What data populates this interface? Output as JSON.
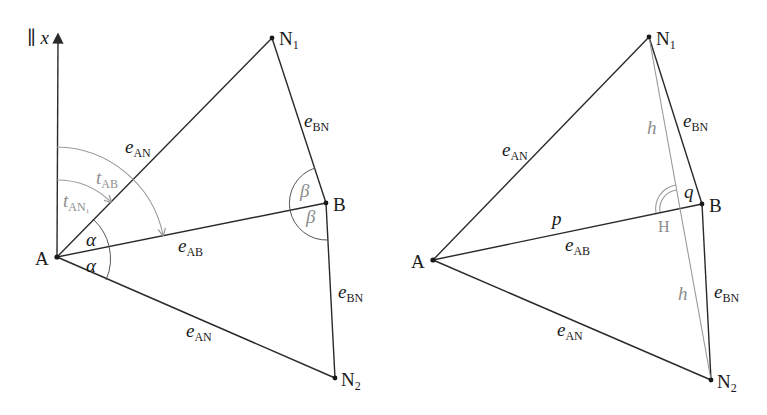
{
  "left_diagram": {
    "axis_label": "∥ x",
    "points": {
      "A": {
        "label": "A",
        "x": 57,
        "y": 257
      },
      "N1": {
        "label": "N",
        "sub": "1",
        "x": 272,
        "y": 38
      },
      "B": {
        "label": "B",
        "x": 326,
        "y": 203
      },
      "N2": {
        "label": "N",
        "sub": "2",
        "x": 335,
        "y": 378
      }
    },
    "edges": {
      "eAN_top": {
        "main": "e",
        "sub": "AN"
      },
      "eAB": {
        "main": "e",
        "sub": "AB"
      },
      "eAN_bottom": {
        "main": "e",
        "sub": "AN"
      },
      "eBN_top": {
        "main": "e",
        "sub": "BN"
      },
      "eBN_bottom": {
        "main": "e",
        "sub": "BN"
      }
    },
    "angles": {
      "tAB": {
        "main": "t",
        "sub": "AB"
      },
      "tAN1": {
        "main": "t",
        "sub": "AN₁"
      },
      "alpha_top": "α",
      "alpha_bottom": "α",
      "beta_top": "β",
      "beta_bottom": "β"
    }
  },
  "right_diagram": {
    "points": {
      "A": {
        "label": "A",
        "x": 433,
        "y": 260
      },
      "N1": {
        "label": "N",
        "sub": "1",
        "x": 649,
        "y": 37
      },
      "B": {
        "label": "B",
        "x": 702,
        "y": 204
      },
      "N2": {
        "label": "N",
        "sub": "2",
        "x": 711,
        "y": 380
      },
      "H": {
        "label": "H",
        "x": 681,
        "y": 208
      }
    },
    "edges": {
      "eAN_top": {
        "main": "e",
        "sub": "AN"
      },
      "eAB": {
        "main": "e",
        "sub": "AB"
      },
      "eAN_bottom": {
        "main": "e",
        "sub": "AN"
      },
      "eBN_top": {
        "main": "e",
        "sub": "BN"
      },
      "eBN_bottom": {
        "main": "e",
        "sub": "BN"
      }
    },
    "segments": {
      "p": "p",
      "q": "q",
      "h_top": "h",
      "h_bottom": "h"
    }
  }
}
